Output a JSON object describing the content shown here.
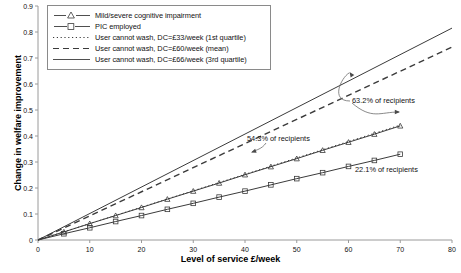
{
  "chart_data": {
    "type": "line",
    "title": "",
    "xlabel": "Level of service £/week",
    "ylabel": "Change in welfare improvement",
    "xlim": [
      0,
      80
    ],
    "ylim": [
      0,
      0.9
    ],
    "xticks": [
      0,
      10,
      20,
      30,
      40,
      50,
      60,
      70,
      80
    ],
    "yticks": [
      0,
      0.1,
      0.2,
      0.3,
      0.4,
      0.5,
      0.6,
      0.7,
      0.8,
      0.9
    ],
    "grid": false,
    "legend_position": "top-left",
    "series": [
      {
        "name": "Mild/severe cognitive impairment",
        "style": "solid-marker-triangle",
        "marker": "triangle",
        "x": [
          0,
          5,
          10,
          15,
          20,
          25,
          30,
          35,
          40,
          45,
          50,
          55,
          60,
          65,
          70
        ],
        "y": [
          0,
          0.031,
          0.063,
          0.094,
          0.125,
          0.157,
          0.188,
          0.219,
          0.251,
          0.282,
          0.313,
          0.345,
          0.376,
          0.407,
          0.439
        ]
      },
      {
        "name": "PIC employed",
        "style": "solid-marker-square",
        "marker": "square",
        "x": [
          0,
          5,
          10,
          15,
          20,
          25,
          30,
          35,
          40,
          45,
          50,
          55,
          60,
          65,
          70
        ],
        "y": [
          0,
          0.024,
          0.047,
          0.071,
          0.094,
          0.118,
          0.141,
          0.165,
          0.188,
          0.212,
          0.236,
          0.259,
          0.283,
          0.306,
          0.33
        ]
      },
      {
        "name": "User cannot wash, DC=£33/week (1st quartile)",
        "style": "dotted",
        "marker": "none",
        "x": [
          0,
          70
        ],
        "y": [
          0,
          0.442
        ]
      },
      {
        "name": "User cannot wash, DC=£60/week (mean)",
        "style": "dashed",
        "marker": "none",
        "x": [
          0,
          80
        ],
        "y": [
          0,
          0.742
        ]
      },
      {
        "name": "User cannot wash, DC=£66/week (3rd quartile)",
        "style": "solid",
        "marker": "none",
        "x": [
          0,
          80
        ],
        "y": [
          0,
          0.815
        ]
      }
    ],
    "annotations": [
      {
        "text": "63.2% of recipients",
        "target_series": "User cannot wash, DC=£60/week (mean)"
      },
      {
        "text": "54.3% of recipients",
        "target_series": "Mild/severe cognitive impairment"
      },
      {
        "text": "22.1% of recipients",
        "target_series": "PIC employed"
      }
    ]
  },
  "legend": {
    "items": [
      {
        "label": "Mild/severe cognitive impairment",
        "key": "solid-line-triangle-marker"
      },
      {
        "label": "PIC employed",
        "key": "solid-line-square-marker"
      },
      {
        "label": "User cannot wash, DC=£33/week (1st quartile)",
        "key": "dotted-line"
      },
      {
        "label": "User cannot wash, DC=£60/week (mean)",
        "key": "dashed-line"
      },
      {
        "label": "User cannot wash, DC=£66/week (3rd quartile)",
        "key": "solid-line"
      }
    ]
  },
  "axes": {
    "x_label": "Level of service £/week",
    "y_label": "Change in welfare improvement",
    "x_tick_labels": [
      "0",
      "10",
      "20",
      "30",
      "40",
      "50",
      "60",
      "70",
      "80"
    ],
    "y_tick_labels": [
      "0",
      "0.1",
      "0.2",
      "0.3",
      "0.4",
      "0.5",
      "0.6",
      "0.7",
      "0.8",
      "0.9"
    ]
  },
  "annotations": {
    "a632": "63.2% of recipients",
    "a543": "54.3% of recipients",
    "a221": "22.1% of recipients"
  },
  "colors": {
    "axis": "#9a9a9a",
    "series": "#3b3b3b",
    "text": "#111111"
  }
}
